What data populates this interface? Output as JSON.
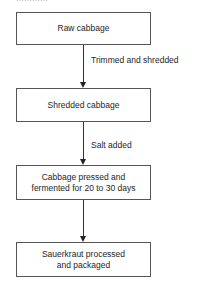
{
  "diagram": {
    "type": "flowchart",
    "direction": "top-to-bottom",
    "header_cutoff": "…………",
    "nodes": [
      {
        "id": "n1",
        "label": "Raw cabbage"
      },
      {
        "id": "n2",
        "label": "Shredded cabbage"
      },
      {
        "id": "n3",
        "label_line1": "Cabbage pressed and",
        "label_line2": "fermented for 20 to 30 days"
      },
      {
        "id": "n4",
        "label_line1": "Sauerkraut processed",
        "label_line2": "and packaged"
      }
    ],
    "edges": [
      {
        "from": "n1",
        "to": "n2",
        "label": "Trimmed and shredded"
      },
      {
        "from": "n2",
        "to": "n3",
        "label": "Salt added"
      },
      {
        "from": "n3",
        "to": "n4",
        "label": ""
      }
    ]
  }
}
